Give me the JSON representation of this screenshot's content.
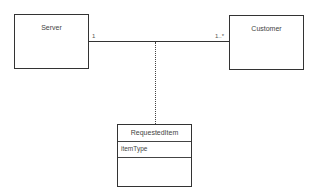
{
  "diagram": {
    "type": "UML class diagram (association class)",
    "classes": [
      {
        "name": "Server",
        "attributes": []
      },
      {
        "name": "Customer",
        "attributes": []
      },
      {
        "name": "RequestedItem",
        "attributes": [
          "itemType"
        ]
      }
    ],
    "association": {
      "from": "Server",
      "to": "Customer",
      "from_multiplicity": "1",
      "to_multiplicity": "1..*",
      "association_class": "RequestedItem"
    }
  }
}
